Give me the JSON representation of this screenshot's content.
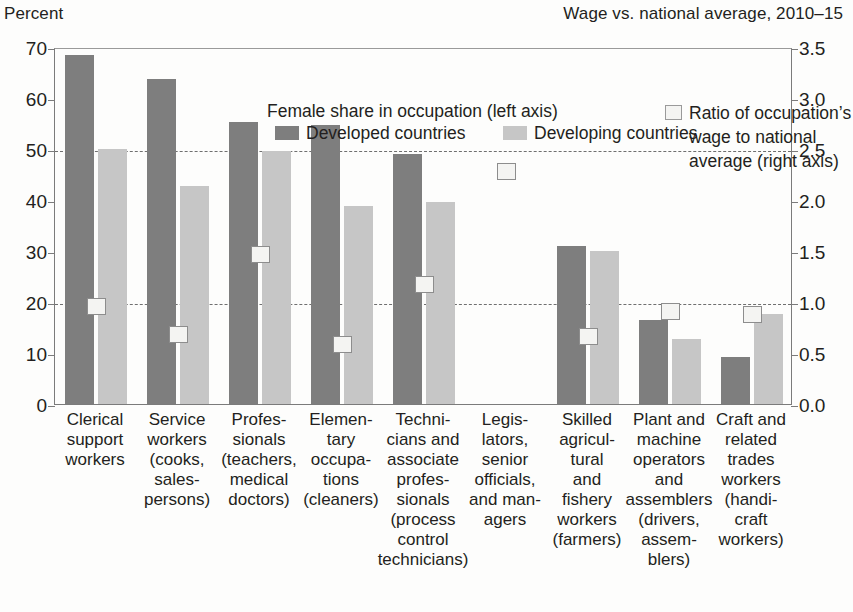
{
  "axis_titles": {
    "left": "Percent",
    "right": "Wage vs. national average, 2010–15"
  },
  "legend": {
    "title": "Female share in occupation (left axis)",
    "developed": "Developed countries",
    "developing": "Developing countries",
    "ratio_lines": [
      "Ratio of occupation’s",
      "wage to national",
      "average (right axis)"
    ]
  },
  "colors": {
    "developed": "#7e7e7e",
    "developing": "#c6c6c6",
    "ratio_marker_fill": "#f4f4f2",
    "ratio_marker_border": "#8d8d8d",
    "axis": "#7b7b7b",
    "gridline": "#6f6f6f",
    "text": "#231f20",
    "background": "#fdfdfc"
  },
  "chart_data": {
    "type": "bar",
    "title": "",
    "subtitle": "",
    "xlabel": "",
    "ylabel": "Percent",
    "ylabel_right": "Wage vs. national average, 2010–15",
    "ylim": [
      0,
      70
    ],
    "ylim_right": [
      0.0,
      3.5
    ],
    "yticks": [
      0,
      10,
      20,
      30,
      40,
      50,
      60,
      70
    ],
    "yticks_right": [
      "0.0",
      "0.5",
      "1.0",
      "1.5",
      "2.0",
      "2.5",
      "3.0",
      "3.5"
    ],
    "grid": "horizontal dashed at left 20 and 50 (right 1.0 and 2.5)",
    "gridlines_left": [
      20,
      50
    ],
    "legend_position": "inside-top-center",
    "categories": [
      "Clerical support workers",
      "Service workers (cooks, salespersons)",
      "Professionals (teachers, medical doctors)",
      "Elementary occupations (cleaners)",
      "Technicians and associate professionals (process control technicians)",
      "Legislators, senior officials, and managers",
      "Skilled agricultural and fishery workers (farmers)",
      "Plant and machine operators and assemblers (drivers, assemblers)",
      "Craft and related trades workers (handicraft workers)"
    ],
    "category_label_lines": [
      [
        "Clerical",
        "support",
        "workers"
      ],
      [
        "Service",
        "workers",
        "(cooks,",
        "sales-",
        "persons)"
      ],
      [
        "Profes-",
        "sionals",
        "(teachers,",
        "medical",
        "doctors)"
      ],
      [
        "Elemen-",
        "tary",
        "occupa-",
        "tions",
        "(cleaners)"
      ],
      [
        "Techni-",
        "cians and",
        "associate",
        "profes-",
        "sionals",
        "(process",
        "control",
        "technicians)"
      ],
      [
        "Legis-",
        "lators,",
        "senior",
        "officials,",
        "and man-",
        "agers"
      ],
      [
        "Skilled",
        "agricul-",
        "tural",
        "and",
        "fishery",
        "workers",
        "(farmers)"
      ],
      [
        "Plant and",
        "machine",
        "operators",
        "and",
        "assemblers",
        "(drivers,",
        "assem-",
        "blers)"
      ],
      [
        "Craft and",
        "related",
        "trades",
        "workers",
        "(handi-",
        "craft",
        "workers)"
      ]
    ],
    "series": [
      {
        "name": "Developed countries",
        "axis": "left",
        "unit": "percent",
        "values": [
          68.5,
          63.8,
          55.3,
          54.8,
          49.0,
          null,
          31.0,
          16.4,
          9.3
        ]
      },
      {
        "name": "Developing countries",
        "axis": "left",
        "unit": "percent",
        "values": [
          50.0,
          42.7,
          49.6,
          38.9,
          39.7,
          null,
          30.0,
          12.7,
          17.6
        ]
      },
      {
        "name": "Ratio of occupation’s wage to national average",
        "axis": "right",
        "unit": "ratio",
        "marker": "square",
        "values": [
          0.98,
          0.7,
          1.49,
          0.6,
          1.19,
          2.3,
          0.68,
          0.93,
          0.9
        ]
      }
    ]
  }
}
